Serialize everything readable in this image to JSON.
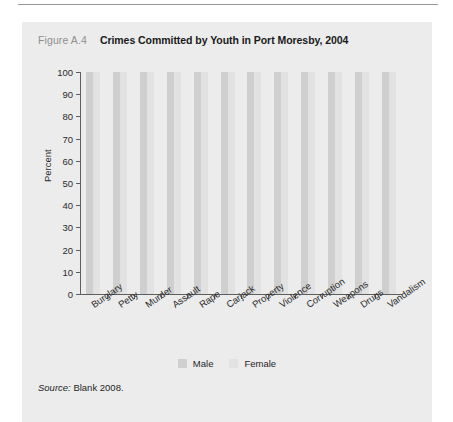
{
  "figure": {
    "number_label": "Figure A.4",
    "title": "Crimes Committed by Youth in Port Moresby, 2004",
    "source_prefix": "Source:",
    "source_text": "Blank 2008."
  },
  "legend": {
    "male_label": "Male",
    "female_label": "Female",
    "male_color": "#cfcfcf",
    "female_color": "#e2e2e2"
  },
  "chart_data": {
    "type": "bar",
    "title": "Crimes Committed by Youth in Port Moresby, 2004",
    "xlabel": "",
    "ylabel": "Percent",
    "ylim": [
      0,
      100
    ],
    "yticks": [
      0,
      10,
      20,
      30,
      40,
      50,
      60,
      70,
      80,
      90,
      100
    ],
    "ytick_labels": [
      "0",
      "10",
      "20",
      "30",
      "40",
      "50",
      "60",
      "70",
      "80",
      "90",
      "100"
    ],
    "grid": false,
    "legend_position": "bottom-center",
    "categories": [
      "Burglary",
      "Petty",
      "Murder",
      "Assault",
      "Rape",
      "Carjack",
      "Property",
      "Violence",
      "Corruption",
      "Weapons",
      "Drugs",
      "Vandalism"
    ],
    "series": [
      {
        "name": "Male",
        "color": "#cfcfcf",
        "values": [
          100,
          100,
          100,
          100,
          100,
          100,
          100,
          100,
          100,
          100,
          100,
          100
        ]
      },
      {
        "name": "Female",
        "color": "#e2e2e2",
        "values": [
          100,
          100,
          100,
          100,
          100,
          100,
          100,
          100,
          100,
          100,
          100,
          100
        ]
      }
    ]
  }
}
